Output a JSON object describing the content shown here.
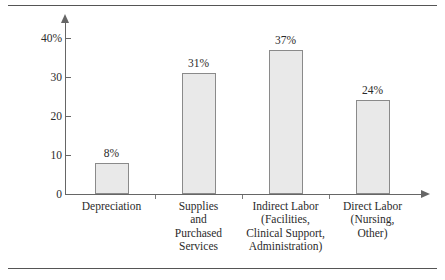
{
  "figure": {
    "has_top_rule": true,
    "has_bottom_rule": true,
    "rule_color": "#555555",
    "background": "#ffffff"
  },
  "chart_data": {
    "type": "bar",
    "title": "",
    "subtitle": "",
    "xlabel": "",
    "ylabel": "",
    "ylim": [
      0,
      40
    ],
    "grid": false,
    "legend": null,
    "categories": [
      "Depreciation",
      "Supplies and Purchased Services",
      "Indirect Labor (Facilities, Clinical Support, Administration)",
      "Direct Labor (Nursing, Other)"
    ],
    "category_lines": [
      [
        "Depreciation"
      ],
      [
        "Supplies",
        "and",
        "Purchased",
        "Services"
      ],
      [
        "Indirect Labor",
        "(Facilities,",
        "Clinical Support,",
        "Administration)"
      ],
      [
        "Direct Labor",
        "(Nursing,",
        "Other)"
      ]
    ],
    "values": [
      8,
      31,
      37,
      24
    ],
    "data_labels": [
      "8%",
      "31%",
      "37%",
      "24%"
    ],
    "ytick_values": [
      0,
      10,
      20,
      30,
      40
    ],
    "ytick_labels": [
      "0",
      "10",
      "20",
      "30",
      "40%"
    ],
    "bar_fill": "#e9e9e9",
    "bar_border": "#8a8a8a",
    "axis_color": "#666666",
    "text_color": "#2b2b2b"
  }
}
